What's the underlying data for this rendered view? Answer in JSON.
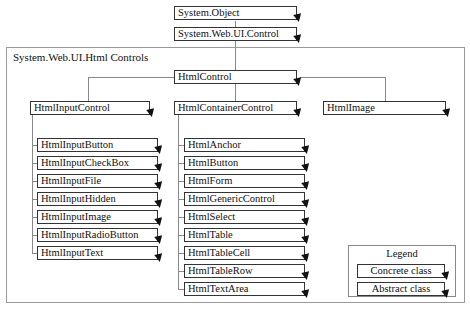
{
  "root": {
    "object": "System.Object",
    "control": "System.Web.UI.Control"
  },
  "namespace": {
    "title": "System.Web.UI.Html Controls",
    "base": "HtmlControl",
    "branches": {
      "input": {
        "label": "HtmlInputControl",
        "children": [
          "HtmlInputButton",
          "HtmlInputCheckBox",
          "HtmlInputFile",
          "HtmlInputHidden",
          "HtmlInputImage",
          "HtmlInputRadioButton",
          "HtmlInputText"
        ]
      },
      "container": {
        "label": "HtmlContainerControl",
        "children": [
          "HtmlAnchor",
          "HtmlButton",
          "HtmlForm",
          "HtmlGenericControl",
          "HtmlSelect",
          "HtmlTable",
          "HtmlTableCell",
          "HtmlTableRow",
          "HtmlTextArea"
        ]
      },
      "image": {
        "label": "HtmlImage"
      }
    }
  },
  "legend": {
    "title": "Legend",
    "concrete": "Concrete class",
    "abstract": "Abstract class"
  }
}
